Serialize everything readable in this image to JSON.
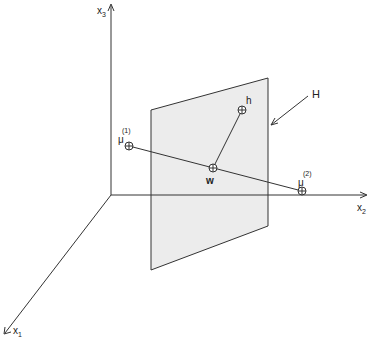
{
  "diagram": {
    "axes": {
      "x1": {
        "label": "x",
        "subscript": "1"
      },
      "x2": {
        "label": "x",
        "subscript": "2"
      },
      "x3": {
        "label": "x",
        "subscript": "3"
      }
    },
    "plane": {
      "label": "H",
      "fill": "#ececec",
      "stroke": "#333333"
    },
    "points": {
      "mu1": {
        "label": "μ",
        "superscript": "(1)"
      },
      "mu2": {
        "label": "μ",
        "superscript": "(2)"
      },
      "w": {
        "label": "w"
      },
      "h": {
        "label": "h"
      }
    },
    "colors": {
      "line": "#333333",
      "background": "#ffffff"
    }
  }
}
